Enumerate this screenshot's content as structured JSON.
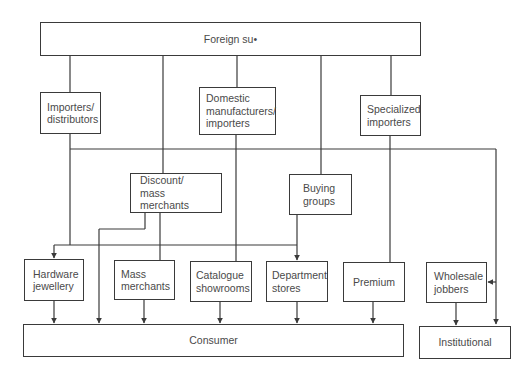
{
  "diagram": {
    "type": "distribution-channel-flowchart",
    "line_color": "#3a3a3a",
    "nodes": {
      "foreign_supplier": {
        "label": "Foreign su•"
      },
      "importers_distributors": {
        "label": "Importers/\ndistributors"
      },
      "domestic_manufacturers": {
        "label": "Domestic\nmanufacturers/\nimporters"
      },
      "specialized_importers": {
        "label": "Specialized\nimporters"
      },
      "discount_mass_merchants": {
        "label": "Discount/\nmass merchants"
      },
      "buying_groups": {
        "label": "Buying\ngroups"
      },
      "hardware_jewellery": {
        "label": "Hardware\njewellery"
      },
      "mass_merchants": {
        "label": "Mass\nmerchants"
      },
      "catalogue_showrooms": {
        "label": "Catalogue\nshowrooms"
      },
      "department_stores": {
        "label": "Department\nstores"
      },
      "premium": {
        "label": "Premium"
      },
      "wholesale_jobbers": {
        "label": "Wholesale\njobbers"
      },
      "consumer": {
        "label": "Consumer"
      },
      "institutional": {
        "label": "Institutional"
      }
    },
    "edges": [
      [
        "foreign_supplier",
        "importers_distributors"
      ],
      [
        "foreign_supplier",
        "discount_mass_merchants"
      ],
      [
        "foreign_supplier",
        "domestic_manufacturers"
      ],
      [
        "foreign_supplier",
        "buying_groups"
      ],
      [
        "foreign_supplier",
        "specialized_importers"
      ],
      [
        "importers_distributors",
        "hardware_jewellery"
      ],
      [
        "importers_distributors",
        "wholesale_jobbers"
      ],
      [
        "importers_distributors",
        "institutional"
      ],
      [
        "discount_mass_merchants",
        "consumer"
      ],
      [
        "discount_mass_merchants",
        "mass_merchants"
      ],
      [
        "domestic_manufacturers",
        "catalogue_showrooms"
      ],
      [
        "buying_groups",
        "department_stores"
      ],
      [
        "specialized_importers",
        "premium"
      ],
      [
        "hardware_jewellery",
        "consumer"
      ],
      [
        "mass_merchants",
        "consumer"
      ],
      [
        "catalogue_showrooms",
        "consumer"
      ],
      [
        "department_stores",
        "consumer"
      ],
      [
        "premium",
        "consumer"
      ],
      [
        "wholesale_jobbers",
        "institutional"
      ]
    ]
  }
}
